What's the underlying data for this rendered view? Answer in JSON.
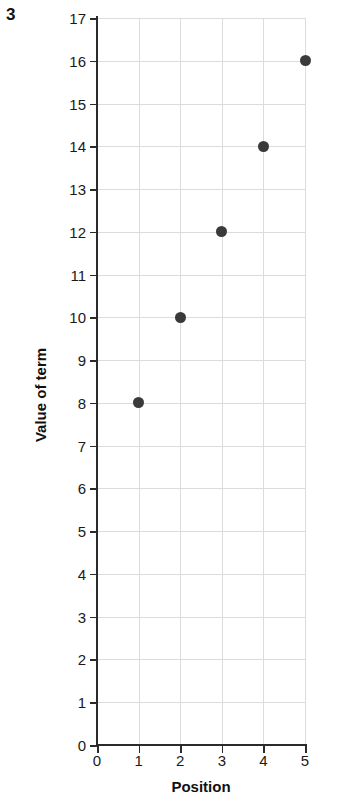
{
  "question_number": "3",
  "chart_data": {
    "type": "scatter",
    "title": "",
    "xlabel": "Position",
    "ylabel": "Value of term",
    "x": [
      1,
      2,
      3,
      4,
      5
    ],
    "values": [
      8,
      10,
      12,
      14,
      16
    ],
    "points": [
      {
        "x": 1,
        "y": 8
      },
      {
        "x": 2,
        "y": 10
      },
      {
        "x": 3,
        "y": 12
      },
      {
        "x": 4,
        "y": 14
      },
      {
        "x": 5,
        "y": 16
      }
    ],
    "xlim": [
      0,
      5
    ],
    "ylim": [
      0,
      17
    ],
    "xticks": [
      "0",
      "1",
      "2",
      "3",
      "4",
      "5"
    ],
    "yticks": [
      "0",
      "1",
      "2",
      "3",
      "4",
      "5",
      "6",
      "7",
      "8",
      "9",
      "10",
      "11",
      "12",
      "13",
      "14",
      "15",
      "16",
      "17"
    ],
    "grid": true,
    "legend": false,
    "marker_color": "#3a3a3a",
    "grid_color": "#dcdcdc",
    "axis_color": "#2b2b2b"
  }
}
